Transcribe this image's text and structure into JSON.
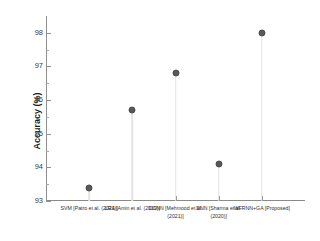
{
  "chart_data": {
    "type": "scatter",
    "title": "",
    "xlabel": "",
    "ylabel": "Accuracy (%)",
    "ylim": [
      93,
      98.5
    ],
    "ytick_step": 1,
    "yminor_step": 0.5,
    "grid": false,
    "legend": "none",
    "marker_style": "filled-circle-with-droplines",
    "categories": [
      "SVM [Patro et al. (2021)]",
      "LRA [Amin et al. (2019)]",
      "DCNN [Mehmood et al. (2021)]",
      "DNN [Sharma et al. (2020)]",
      "WFRNN+GA [Proposed]"
    ],
    "values": [
      93.4,
      95.7,
      96.8,
      94.1,
      98.0
    ],
    "ytick_labels": [
      "93",
      "94",
      "95",
      "96",
      "97",
      "98"
    ],
    "ytick_values": [
      93,
      94,
      95,
      96,
      97,
      98
    ]
  },
  "style": {
    "marker_color": "#595959",
    "stem_color": "#e4e4e4",
    "axis_color": "#8a8a8a",
    "text_color": "#2e2e2e",
    "background": "#ffffff"
  }
}
